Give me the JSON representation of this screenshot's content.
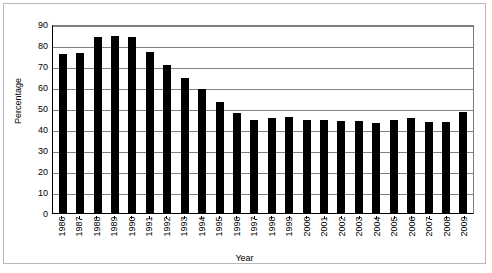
{
  "chart_data": {
    "type": "bar",
    "title": "",
    "xlabel": "Year",
    "ylabel": "Percentage",
    "ylim": [
      0,
      90
    ],
    "yticks": [
      0,
      10,
      20,
      30,
      40,
      50,
      60,
      70,
      80,
      90
    ],
    "grid": true,
    "legend": null,
    "bar_color": "#000000",
    "categories": [
      "1986",
      "1987",
      "1988",
      "1989",
      "1990",
      "1991",
      "1992",
      "1993",
      "1994",
      "1995",
      "1996",
      "1997",
      "1998",
      "1999",
      "2000",
      "2001",
      "2002",
      "2003",
      "2004",
      "2005",
      "2006",
      "2007",
      "2008",
      "2009"
    ],
    "values": [
      75.6,
      76.1,
      83.7,
      84.1,
      83.7,
      76.8,
      70.3,
      64.2,
      59.0,
      52.7,
      47.4,
      44.4,
      45.1,
      45.6,
      44.3,
      44.1,
      43.8,
      43.8,
      43.0,
      44.2,
      45.3,
      43.4,
      43.2,
      47.9
    ]
  },
  "axes": {
    "y_title": "Percentage",
    "x_title": "Year"
  }
}
